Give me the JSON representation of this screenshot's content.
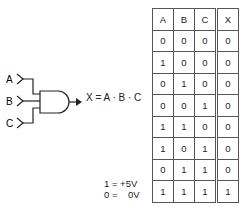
{
  "gate": {
    "type": "AND",
    "inputs": [
      "A",
      "B",
      "C"
    ],
    "output_expression": "X = A · B · C"
  },
  "truth_table": {
    "headers": [
      "A",
      "B",
      "C",
      "X"
    ],
    "rows": [
      [
        "0",
        "0",
        "0",
        "0"
      ],
      [
        "1",
        "0",
        "0",
        "0"
      ],
      [
        "0",
        "1",
        "0",
        "0"
      ],
      [
        "0",
        "0",
        "1",
        "0"
      ],
      [
        "1",
        "1",
        "0",
        "0"
      ],
      [
        "1",
        "0",
        "1",
        "0"
      ],
      [
        "0",
        "1",
        "1",
        "0"
      ],
      [
        "1",
        "1",
        "1",
        "1"
      ]
    ]
  },
  "legend": {
    "line1": "1 = +5V",
    "line2": "0 =    0V"
  }
}
